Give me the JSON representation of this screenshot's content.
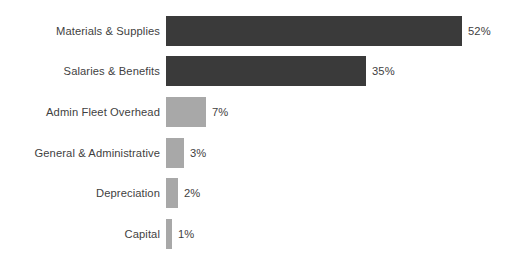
{
  "chart_data": {
    "type": "bar",
    "orientation": "horizontal",
    "title": "",
    "subtitle": "",
    "xlabel": "",
    "ylabel": "",
    "xlim": [
      0,
      57
    ],
    "grid": false,
    "legend": false,
    "legend_position": "none",
    "value_suffix": "%",
    "categories": [
      "Materials & Supplies",
      "Salaries & Benefits",
      "Admin Fleet Overhead",
      "General & Administrative",
      "Depreciation",
      "Capital"
    ],
    "values": [
      52,
      35,
      7,
      3,
      2,
      1
    ],
    "data_labels": [
      "52%",
      "35%",
      "7%",
      "3%",
      "2%",
      "1%"
    ],
    "colors": [
      "#3a3a3a",
      "#3a3a3a",
      "#a8a8a8",
      "#a8a8a8",
      "#a8a8a8",
      "#a8a8a8"
    ],
    "tick_labels": [],
    "annotations": []
  },
  "bars": [
    {
      "label": "Materials & Supplies",
      "value": 52,
      "value_label": "52%",
      "color": "#3a3a3a",
      "top": 16,
      "height": 30,
      "width": 296
    },
    {
      "label": "Salaries & Benefits",
      "value": 35,
      "value_label": "35%",
      "color": "#3a3a3a",
      "top": 56,
      "height": 30,
      "width": 200
    },
    {
      "label": "Admin Fleet Overhead",
      "value": 7,
      "value_label": "7%",
      "color": "#a8a8a8",
      "top": 97,
      "height": 30,
      "width": 40
    },
    {
      "label": "General & Administrative",
      "value": 3,
      "value_label": "3%",
      "color": "#a8a8a8",
      "top": 138,
      "height": 30,
      "width": 18
    },
    {
      "label": "Depreciation",
      "value": 2,
      "value_label": "2%",
      "color": "#a8a8a8",
      "top": 178,
      "height": 30,
      "width": 12
    },
    {
      "label": "Capital",
      "value": 1,
      "value_label": "1%",
      "color": "#a8a8a8",
      "top": 219,
      "height": 30,
      "width": 6
    }
  ]
}
